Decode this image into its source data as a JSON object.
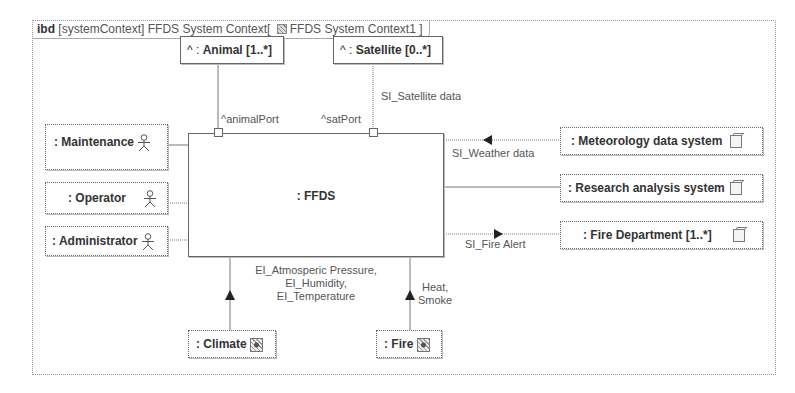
{
  "frame": {
    "kind": "ibd",
    "stereotype": "[systemContext]",
    "name": "FFDS System Context",
    "context_open": "[",
    "context_name": "FFDS System Context1",
    "context_close": "]"
  },
  "central_block": {
    "label": ": FFDS"
  },
  "top_parts": [
    {
      "label_prefix": "^ : ",
      "label": "Animal [1..*]",
      "port": "^animalPort"
    },
    {
      "label_prefix": "^ : ",
      "label": "Satellite [0..*]",
      "port": "^satPort",
      "flow": "SI_Satellite data"
    }
  ],
  "actors": [
    {
      "label": ": Maintenance",
      "icon": "actor-icon"
    },
    {
      "label": ": Operator",
      "icon": "actor-icon"
    },
    {
      "label": ": Administrator",
      "icon": "actor-icon"
    }
  ],
  "external_systems": [
    {
      "label": ": Meteorology data system",
      "icon": "block-icon",
      "flow": "SI_Weather data"
    },
    {
      "label": ": Research analysis system",
      "icon": "block-icon"
    },
    {
      "label": ": Fire Department [1..*]",
      "icon": "block-icon",
      "flow": "SI_Fire Alert"
    }
  ],
  "environment": [
    {
      "label": ": Climate",
      "icon": "environment-icon",
      "flow_lines": [
        "EI_Atmosperic Pressure,",
        "EI_Humidity,",
        "EI_Temperature"
      ]
    },
    {
      "label": ": Fire",
      "icon": "environment-icon",
      "flow_lines": [
        "Heat,",
        "Smoke"
      ]
    }
  ]
}
